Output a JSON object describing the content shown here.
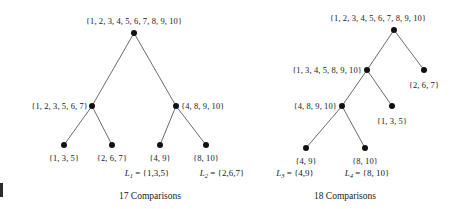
{
  "figure": {
    "background_color": "#ffffff",
    "node_color": "#111111",
    "edge_color": "#5a5a5a"
  },
  "left_tree": {
    "caption": "17 Comparisons",
    "nodes": [
      {
        "id": "L-root",
        "label": "{1, 2, 3, 4, 5, 6, 7, 8, 9, 10}",
        "x": 134,
        "y": 33,
        "label_pos": "above",
        "label_x": 134,
        "label_y": 26
      },
      {
        "id": "L-n1",
        "label": "{1, 2, 3, 5, 6, 7}",
        "x": 92,
        "y": 106,
        "label_pos": "left",
        "label_x": 88,
        "label_y": 106
      },
      {
        "id": "L-n2",
        "label": "{4, 8, 9, 10}",
        "x": 176,
        "y": 106,
        "label_pos": "right",
        "label_x": 181,
        "label_y": 106
      },
      {
        "id": "L-leaf1",
        "label": "{1, 3, 5}",
        "x": 64,
        "y": 145,
        "label_pos": "center",
        "label_x": 64,
        "label_y": 153
      },
      {
        "id": "L-leaf2",
        "label": "{2, 6, 7}",
        "x": 112,
        "y": 145,
        "label_pos": "center",
        "label_x": 112,
        "label_y": 153
      },
      {
        "id": "L-leaf3",
        "label": "{4, 9}",
        "x": 160,
        "y": 145,
        "label_pos": "center",
        "label_x": 160,
        "label_y": 153
      },
      {
        "id": "L-leaf4",
        "label": "{8, 10}",
        "x": 206,
        "y": 145,
        "label_pos": "center",
        "label_x": 206,
        "label_y": 153
      }
    ],
    "edges": [
      {
        "from": "L-root",
        "to": "L-n1"
      },
      {
        "from": "L-root",
        "to": "L-n2"
      },
      {
        "from": "L-n1",
        "to": "L-leaf1"
      },
      {
        "from": "L-n1",
        "to": "L-leaf2"
      },
      {
        "from": "L-n2",
        "to": "L-leaf3"
      },
      {
        "from": "L-n2",
        "to": "L-leaf4"
      }
    ],
    "caption_x": 150,
    "caption_y": 196
  },
  "right_tree": {
    "caption": "18 Comparisons",
    "nodes": [
      {
        "id": "R-root",
        "label": "{1, 2, 3, 4, 5, 6, 7, 8, 9, 10}",
        "x": 394,
        "y": 30,
        "label_pos": "above",
        "label_x": 378,
        "label_y": 23
      },
      {
        "id": "R-n1",
        "label": "{1, 3, 4, 5, 8, 9, 10}",
        "x": 367,
        "y": 70,
        "label_pos": "left",
        "label_x": 362,
        "label_y": 70
      },
      {
        "id": "R-n2",
        "label": "{2, 6, 7}",
        "x": 424,
        "y": 70,
        "label_pos": "center",
        "label_x": 424,
        "label_y": 80
      },
      {
        "id": "R-n3",
        "label": "{4, 8, 9, 10}",
        "x": 342,
        "y": 106,
        "label_pos": "left",
        "label_x": 337,
        "label_y": 106
      },
      {
        "id": "R-n4",
        "label": "{1, 3, 5}",
        "x": 392,
        "y": 106,
        "label_pos": "center",
        "label_x": 392,
        "label_y": 116
      },
      {
        "id": "R-leaf1",
        "label": "{4, 9}",
        "x": 306,
        "y": 148,
        "label_pos": "center",
        "label_x": 306,
        "label_y": 156
      },
      {
        "id": "R-leaf2",
        "label": "{8, 10}",
        "x": 365,
        "y": 148,
        "label_pos": "center",
        "label_x": 365,
        "label_y": 156
      }
    ],
    "edges": [
      {
        "from": "R-root",
        "to": "R-n1"
      },
      {
        "from": "R-root",
        "to": "R-n2"
      },
      {
        "from": "R-n1",
        "to": "R-n3"
      },
      {
        "from": "R-n1",
        "to": "R-n4"
      },
      {
        "from": "R-n3",
        "to": "R-leaf1"
      },
      {
        "from": "R-n3",
        "to": "R-leaf2"
      }
    ],
    "caption_x": 345,
    "caption_y": 196
  },
  "list_labels": [
    {
      "id": "L1",
      "name": "L",
      "sub": "1",
      "eq": "=",
      "value": "{1,3,5}",
      "x": 147,
      "y": 173
    },
    {
      "id": "L2",
      "name": "L",
      "sub": "2",
      "eq": "=",
      "value": "{2,6,7}",
      "x": 222,
      "y": 173
    },
    {
      "id": "L3",
      "name": "L",
      "sub": "3",
      "eq": "=",
      "value": "{4,9}",
      "x": 295,
      "y": 173
    },
    {
      "id": "L4",
      "name": "L",
      "sub": "4",
      "eq": "=",
      "value": "{8, 10}",
      "x": 367,
      "y": 173
    }
  ]
}
